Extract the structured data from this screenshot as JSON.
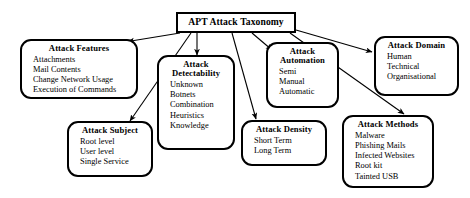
{
  "diagram": {
    "type": "tree",
    "title": "APT Attack Taxonomy",
    "root": {
      "label": "APT Attack Taxonomy"
    },
    "nodes": [
      {
        "id": "attack-features",
        "title": "Attack Features",
        "title_lines": [
          "Attack Features"
        ],
        "items": [
          "Attachments",
          "Mail Contents",
          "Change Network Usage",
          "Execution of Commands"
        ]
      },
      {
        "id": "attack-subject",
        "title": "Attack Subject",
        "title_lines": [
          "Attack Subject"
        ],
        "items": [
          "Root level",
          "User level",
          "Single Service"
        ]
      },
      {
        "id": "attack-detectability",
        "title": "Attack Detectability",
        "title_lines": [
          "Attack",
          "Detectability"
        ],
        "items": [
          "Unknown",
          "Botnets",
          "Combination",
          "Heuristics",
          "Knowledge"
        ]
      },
      {
        "id": "attack-automation",
        "title": "Attack Automation",
        "title_lines": [
          "Attack",
          "Automation"
        ],
        "items": [
          "Semi",
          "Manual",
          "Automatic"
        ]
      },
      {
        "id": "attack-density",
        "title": "Attack Density",
        "title_lines": [
          "Attack Density"
        ],
        "items": [
          "Short Term",
          "Long Term"
        ]
      },
      {
        "id": "attack-domain",
        "title": "Attack Domain",
        "title_lines": [
          "Attack Domain"
        ],
        "items": [
          "Human",
          "Technical",
          "Organisational"
        ]
      },
      {
        "id": "attack-methods",
        "title": "Attack Methods",
        "title_lines": [
          "Attack Methods"
        ],
        "items": [
          "Malware",
          "Phishing Mails",
          "Infected Websites",
          "Root kit",
          "Tainted USB"
        ]
      }
    ],
    "colors": {
      "stroke": "#000000",
      "background": "#ffffff",
      "text": "#000000"
    }
  },
  "labels": {
    "root": "APT Attack Taxonomy",
    "features_title": "Attack Features",
    "features_i0": "Attachments",
    "features_i1": "Mail Contents",
    "features_i2": "Change Network Usage",
    "features_i3": "Execution of Commands",
    "subject_title": "Attack Subject",
    "subject_i0": "Root level",
    "subject_i1": "User level",
    "subject_i2": "Single Service",
    "detect_title_a": "Attack",
    "detect_title_b": "Detectability",
    "detect_i0": "Unknown",
    "detect_i1": "Botnets",
    "detect_i2": "Combination",
    "detect_i3": "Heuristics",
    "detect_i4": "Knowledge",
    "auto_title_a": "Attack",
    "auto_title_b": "Automation",
    "auto_i0": "Semi",
    "auto_i1": "Manual",
    "auto_i2": "Automatic",
    "density_title": "Attack Density",
    "density_i0": "Short Term",
    "density_i1": "Long Term",
    "domain_title": "Attack Domain",
    "domain_i0": "Human",
    "domain_i1": "Technical",
    "domain_i2": "Organisational",
    "methods_title": "Attack Methods",
    "methods_i0": "Malware",
    "methods_i1": "Phishing Mails",
    "methods_i2": "Infected Websites",
    "methods_i3": "Root kit",
    "methods_i4": "Tainted USB"
  }
}
